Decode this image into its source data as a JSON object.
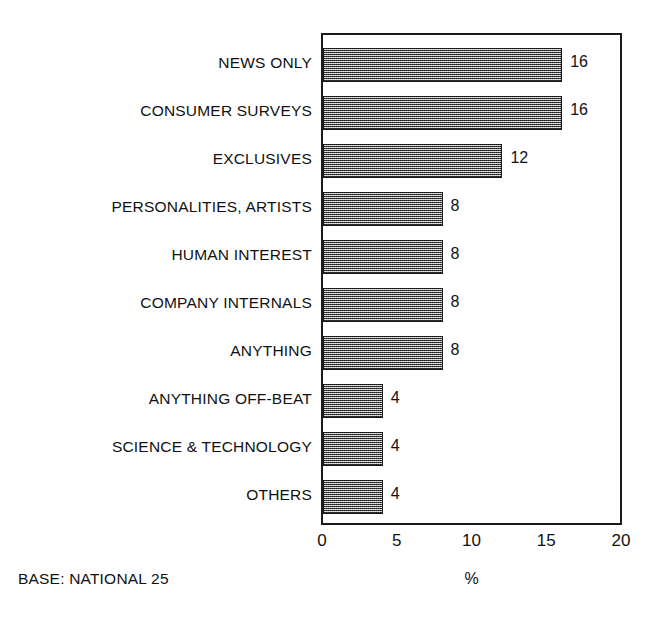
{
  "chart_data": {
    "type": "bar",
    "orientation": "horizontal",
    "title": "",
    "subtitle": "",
    "xlabel": "%",
    "ylabel": "",
    "xlim": [
      0,
      20
    ],
    "xticks": [
      0,
      5,
      10,
      15,
      20
    ],
    "xtick_labels": [
      "0",
      "5",
      "10",
      "15",
      "20"
    ],
    "grid": false,
    "legend": null,
    "categories": [
      "NEWS ONLY",
      "CONSUMER SURVEYS",
      "EXCLUSIVES",
      "PERSONALITIES, ARTISTS",
      "HUMAN INTEREST",
      "COMPANY INTERNALS",
      "ANYTHING",
      "ANYTHING OFF-BEAT",
      "SCIENCE & TECHNOLOGY",
      "OTHERS"
    ],
    "values": [
      16,
      16,
      12,
      8,
      8,
      8,
      8,
      4,
      4,
      4
    ],
    "data_labels": [
      "16",
      "16",
      "12",
      "8",
      "8",
      "8",
      "8",
      "4",
      "4",
      "4"
    ],
    "annotations": [
      "BASE: NATIONAL 25"
    ],
    "bar_fill": "#8a8a8a",
    "bar_edge": "#1c1c1c",
    "frame_color": "#1a1a1a",
    "background": "#ffffff"
  },
  "footer": {
    "base_note": "BASE: NATIONAL 25"
  },
  "axis": {
    "x_title": "%"
  }
}
